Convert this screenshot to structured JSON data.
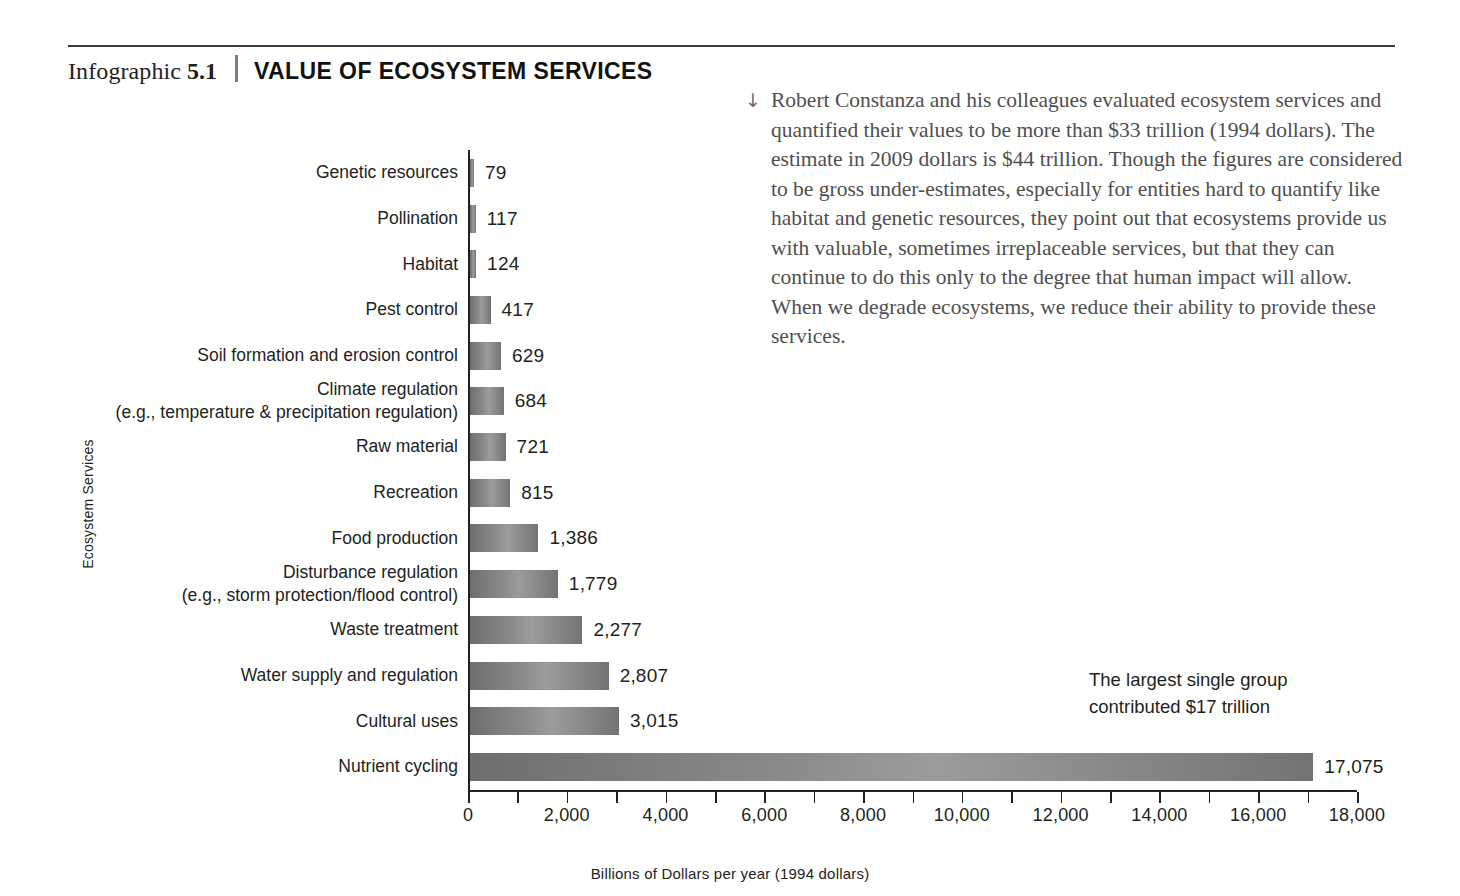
{
  "header": {
    "label": "Infographic",
    "number": "5.1",
    "title": "VALUE OF ECOSYSTEM SERVICES"
  },
  "caption": {
    "arrow_icon": "↓",
    "text": "Robert Constanza and his colleagues evaluated ecosystem services and quantified their values to be more than $33 trillion (1994 dollars). The estimate in 2009 dollars is $44 trillion. Though the figures are considered to be gross under-estimates, especially for entities hard to quantify like habitat and genetic resources, they point out that ecosystems provide us with valuable, sometimes irreplaceable services, but that they can continue to do this only to the degree that human impact will allow. When we degrade ecosystems, we reduce their ability to provide these services."
  },
  "annotation": {
    "line1": "The largest single group",
    "line2": "contributed $17 trillion"
  },
  "chart_data": {
    "type": "bar",
    "orientation": "horizontal",
    "title": "VALUE OF ECOSYSTEM SERVICES",
    "xlabel": "Billions of Dollars per year (1994 dollars)",
    "ylabel": "Ecosystem Services",
    "xlim": [
      0,
      18000
    ],
    "xticks": [
      0,
      1000,
      2000,
      3000,
      4000,
      5000,
      6000,
      7000,
      8000,
      9000,
      10000,
      11000,
      12000,
      13000,
      14000,
      15000,
      16000,
      17000,
      18000
    ],
    "xtick_labels": [
      "0",
      "2,000",
      "4,000",
      "6,000",
      "8,000",
      "10,000",
      "12,000",
      "14,000",
      "16,000",
      "18,000"
    ],
    "xtick_label_values": [
      0,
      2000,
      4000,
      6000,
      8000,
      10000,
      12000,
      14000,
      16000,
      18000
    ],
    "grid": false,
    "legend": false,
    "bar_color": "#8b8b8b",
    "categories": [
      "Genetic resources",
      "Pollination",
      "Habitat",
      "Pest control",
      "Soil formation and erosion control",
      "Climate regulation",
      "Raw material",
      "Recreation",
      "Food production",
      "Disturbance regulation",
      "Waste treatment",
      "Water supply and regulation",
      "Cultural uses",
      "Nutrient cycling"
    ],
    "category_sublabels": [
      "",
      "",
      "",
      "",
      "",
      "(e.g., temperature & precipitation regulation)",
      "",
      "",
      "",
      "(e.g., storm protection/flood control)",
      "",
      "",
      "",
      ""
    ],
    "values": [
      79,
      117,
      124,
      417,
      629,
      684,
      721,
      815,
      1386,
      1779,
      2277,
      2807,
      3015,
      17075
    ],
    "value_labels": [
      "79",
      "117",
      "124",
      "417",
      "629",
      "684",
      "721",
      "815",
      "1,386",
      "1,779",
      "2,277",
      "2,807",
      "3,015",
      "17,075"
    ]
  }
}
